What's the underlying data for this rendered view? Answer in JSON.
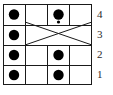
{
  "diagram": {
    "type": "grid-dot-crossing-diagram",
    "grid": {
      "columns": 4,
      "rows": 4,
      "left": 3,
      "top": 4,
      "right": 92,
      "bottom": 85,
      "column_edges": [
        3,
        25,
        47,
        70,
        92
      ],
      "row_edges": [
        4,
        25,
        45,
        65,
        85
      ],
      "line_color": "#000000",
      "line_width": 1,
      "background": "#ffffff"
    },
    "row_labels": [
      {
        "name": "row-label-4",
        "text": "4",
        "row_index": 0
      },
      {
        "name": "row-label-3",
        "text": "3",
        "row_index": 1
      },
      {
        "name": "row-label-2",
        "text": "2",
        "row_index": 2
      },
      {
        "name": "row-label-1",
        "text": "1",
        "row_index": 3
      }
    ],
    "dots": [
      {
        "name": "dot-r4-c1",
        "row": 4,
        "col": 1,
        "cx": 14,
        "cy": 14.5,
        "r": 5.2,
        "color": "#000000"
      },
      {
        "name": "dot-r4-c3",
        "row": 4,
        "col": 3,
        "cx": 58.5,
        "cy": 14.5,
        "r": 5.2,
        "color": "#000000"
      },
      {
        "name": "dot-r3-c1",
        "row": 3,
        "col": 1,
        "cx": 14,
        "cy": 35,
        "r": 5.2,
        "color": "#000000"
      },
      {
        "name": "dot-r3-c3-small",
        "row": 3,
        "col": 3,
        "cx": 58.5,
        "cy": 22,
        "r": 1.6,
        "color": "#000000"
      },
      {
        "name": "dot-r2-c1",
        "row": 2,
        "col": 1,
        "cx": 14,
        "cy": 55,
        "r": 5.2,
        "color": "#000000"
      },
      {
        "name": "dot-r2-c3",
        "row": 2,
        "col": 3,
        "cx": 58.5,
        "cy": 55,
        "r": 5.2,
        "color": "#000000"
      },
      {
        "name": "dot-r1-c1",
        "row": 1,
        "col": 1,
        "cx": 14,
        "cy": 75,
        "r": 5.2,
        "color": "#000000"
      },
      {
        "name": "dot-r1-c3",
        "row": 1,
        "col": 3,
        "cx": 58.5,
        "cy": 75,
        "r": 5.2,
        "color": "#000000"
      }
    ],
    "crossing_lines": [
      {
        "name": "crossing-line-down",
        "x1": 25,
        "y1": 22,
        "x2": 92,
        "y2": 45
      },
      {
        "name": "crossing-line-up",
        "x1": 25,
        "y1": 45,
        "x2": 92,
        "y2": 22
      }
    ]
  }
}
